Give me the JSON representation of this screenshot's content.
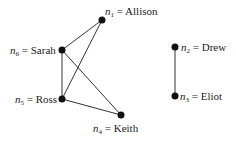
{
  "graph": {
    "nodes": [
      {
        "id": "n1",
        "var": "n",
        "sub": "1",
        "name": "Allison",
        "x": 102,
        "y": 20
      },
      {
        "id": "n2",
        "var": "n",
        "sub": "2",
        "name": "Drew",
        "x": 175,
        "y": 47
      },
      {
        "id": "n3",
        "var": "n",
        "sub": "3",
        "name": "Eliot",
        "x": 175,
        "y": 96
      },
      {
        "id": "n4",
        "var": "n",
        "sub": "4",
        "name": "Keith",
        "x": 121,
        "y": 115
      },
      {
        "id": "n5",
        "var": "n",
        "sub": "5",
        "name": "Ross",
        "x": 62,
        "y": 99
      },
      {
        "id": "n6",
        "var": "n",
        "sub": "6",
        "name": "Sarah",
        "x": 62,
        "y": 50
      }
    ],
    "edges": [
      {
        "from": "n1",
        "to": "n6"
      },
      {
        "from": "n1",
        "to": "n5"
      },
      {
        "from": "n6",
        "to": "n5"
      },
      {
        "from": "n6",
        "to": "n4"
      },
      {
        "from": "n5",
        "to": "n4"
      },
      {
        "from": "n2",
        "to": "n3"
      }
    ],
    "labels": {
      "n1": {
        "eq": " = ",
        "text": "Allison"
      },
      "n2": {
        "eq": " = ",
        "text": "Drew"
      },
      "n3": {
        "eq": " = ",
        "text": "Eliot"
      },
      "n4": {
        "eq": " = ",
        "text": "Keith"
      },
      "n5": {
        "eq": " = ",
        "text": "Ross"
      },
      "n6": {
        "eq": " = ",
        "text": "Sarah"
      }
    }
  }
}
